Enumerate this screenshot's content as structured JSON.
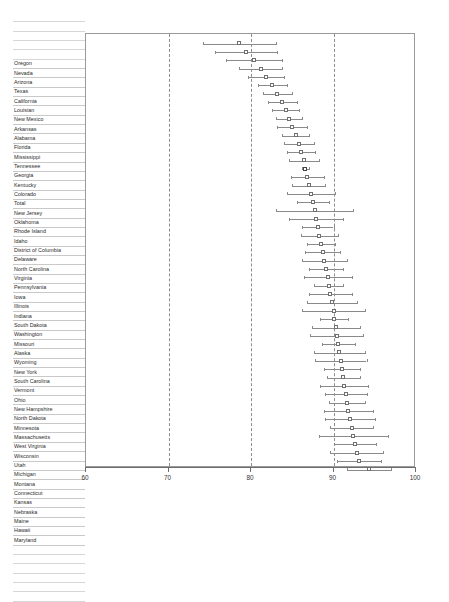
{
  "chart_data": {
    "type": "scatter",
    "title": "",
    "subtitle": "",
    "xlabel": "",
    "ylabel": "",
    "xlim": [
      60,
      100
    ],
    "xticks": [
      60,
      70,
      80,
      90,
      100
    ],
    "xtick_labels": [
      "60",
      "70",
      "80",
      "90",
      "100"
    ],
    "grid": "vertical dashed gridlines at 70, 80, 90",
    "gridlines": [
      70,
      80,
      90
    ],
    "legend": "none",
    "marker": "open square with horizontal confidence-interval whiskers and end caps",
    "orientation": "horizontal forest plot, categories top to bottom",
    "categories": [
      "Oregon",
      "Nevada",
      "Arizona",
      "Texas",
      "California",
      "Louisian",
      "New Mexico",
      "Arkansas",
      "Alabama",
      "Florida",
      "Mississippi",
      "Tennessee",
      "Georgia",
      "Kentucky",
      "Colorado",
      "Total",
      "New Jersey",
      "Oklahoma",
      "Rhode Island",
      "Idaho",
      "District of Columbia",
      "Delaware",
      "North Carolina",
      "Virginia",
      "Pennsylvania",
      "Iowa",
      "Illinois",
      "Indiana",
      "South Dakota",
      "Washington",
      "Missouri",
      "Alaska",
      "Wyoming",
      "New York",
      "South Carolina",
      "Vermont",
      "Ohio",
      "New Hampshire",
      "North Dakota",
      "Minnesota",
      "Massachusetts",
      "West Virginia",
      "Wisconsin",
      "Utah",
      "Michigan",
      "Montana",
      "Connecticut",
      "Kansas",
      "Nebraska",
      "Maine",
      "Hawaii",
      "Maryland"
    ],
    "values": [
      78.6,
      79.4,
      80.4,
      81.2,
      81.8,
      82.6,
      83.2,
      83.8,
      84.2,
      84.6,
      85.0,
      85.4,
      85.8,
      86.1,
      86.4,
      86.6,
      86.8,
      87.0,
      87.3,
      87.5,
      87.7,
      87.9,
      88.1,
      88.3,
      88.5,
      88.7,
      88.9,
      89.1,
      89.3,
      89.4,
      89.6,
      89.8,
      90.0,
      90.1,
      90.3,
      90.4,
      90.6,
      90.7,
      90.9,
      91.0,
      91.2,
      91.3,
      91.5,
      91.6,
      91.8,
      92.0,
      92.2,
      92.4,
      92.6,
      92.8,
      93.1,
      94.3
    ],
    "ci_low": [
      74.2,
      75.6,
      77.0,
      78.6,
      79.6,
      80.8,
      81.4,
      82.0,
      82.6,
      83.0,
      83.2,
      83.8,
      84.0,
      84.4,
      84.6,
      86.2,
      84.8,
      85.0,
      84.4,
      85.6,
      83.0,
      84.6,
      86.2,
      86.0,
      86.8,
      86.6,
      86.2,
      87.0,
      86.4,
      87.6,
      87.0,
      86.8,
      86.2,
      88.4,
      87.4,
      87.2,
      88.6,
      87.6,
      87.8,
      88.8,
      89.2,
      88.4,
      89.0,
      89.4,
      88.8,
      89.0,
      89.6,
      88.2,
      90.0,
      89.6,
      90.4,
      91.6
    ],
    "ci_high": [
      83.0,
      83.2,
      83.8,
      83.8,
      84.0,
      84.4,
      85.0,
      85.6,
      85.8,
      86.2,
      86.8,
      87.0,
      87.6,
      87.8,
      88.2,
      87.0,
      88.8,
      89.0,
      90.2,
      89.4,
      92.4,
      91.2,
      90.0,
      90.6,
      90.2,
      90.8,
      91.6,
      91.2,
      92.2,
      91.2,
      92.2,
      92.8,
      93.8,
      91.8,
      93.2,
      93.6,
      92.6,
      93.8,
      94.0,
      93.2,
      93.2,
      94.2,
      94.0,
      93.8,
      94.8,
      95.0,
      94.8,
      96.6,
      95.2,
      96.0,
      95.8,
      97.0
    ]
  },
  "table": {
    "empty_rows_above": 5
  }
}
